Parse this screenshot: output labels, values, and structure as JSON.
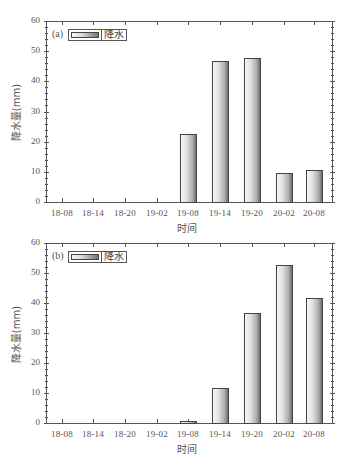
{
  "chart_data": [
    {
      "type": "bar",
      "panel_label": "(a)",
      "categories": [
        "18-08",
        "18-14",
        "18-20",
        "19-02",
        "19-08",
        "19-14",
        "19-20",
        "20-02",
        "20-08"
      ],
      "series": [
        {
          "name": "降水",
          "values": [
            0,
            0,
            0,
            0,
            23,
            47,
            48,
            10,
            11
          ]
        }
      ],
      "title": "",
      "xlabel": "时间",
      "ylabel": "降水量(mm)",
      "ylim": [
        0,
        60
      ],
      "yticks": [
        0,
        10,
        20,
        30,
        40,
        50,
        60
      ],
      "legend": {
        "entries": [
          "降水"
        ],
        "position": "upper-left"
      },
      "grid": false
    },
    {
      "type": "bar",
      "panel_label": "(b)",
      "categories": [
        "18-08",
        "18-14",
        "18-20",
        "19-02",
        "19-08",
        "19-14",
        "19-20",
        "20-02",
        "20-08"
      ],
      "series": [
        {
          "name": "降水",
          "values": [
            0,
            0,
            0,
            0,
            1,
            12,
            37,
            53,
            42
          ]
        }
      ],
      "title": "",
      "xlabel": "时间",
      "ylabel": "降水量(mm)",
      "ylim": [
        0,
        60
      ],
      "yticks": [
        0,
        10,
        20,
        30,
        40,
        50,
        60
      ],
      "legend": {
        "entries": [
          "降水"
        ],
        "position": "upper-left"
      },
      "grid": false
    }
  ],
  "panels": [
    {
      "tag": "(a)",
      "legend_label": "降水",
      "ylabel": "降水量(mm)",
      "xlabel": "时间"
    },
    {
      "tag": "(b)",
      "legend_label": "降水",
      "ylabel": "降水量(mm)",
      "xlabel": "时间"
    }
  ]
}
